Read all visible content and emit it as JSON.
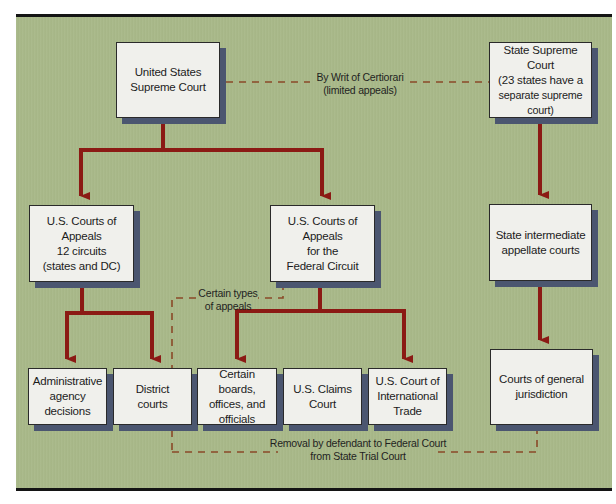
{
  "diagram": {
    "nodes": {
      "us_supreme_court": {
        "lines": [
          "United States",
          "Supreme Court"
        ]
      },
      "state_supreme_court": {
        "lines": [
          "State Supreme Court",
          "(23 states have a",
          "separate supreme court)"
        ]
      },
      "us_courts_of_appeals": {
        "lines": [
          "U.S. Courts of Appeals",
          "12 circuits",
          "(states and DC)"
        ]
      },
      "federal_circuit": {
        "lines": [
          "U.S. Courts of Appeals",
          "for the",
          "Federal Circuit"
        ]
      },
      "state_intermediate": {
        "lines": [
          "State intermediate",
          "appellate courts"
        ]
      },
      "admin_agency": {
        "lines": [
          "Administrative",
          "agency",
          "decisions"
        ]
      },
      "district_courts": {
        "lines": [
          "District",
          "courts"
        ]
      },
      "certain_boards": {
        "lines": [
          "Certain boards,",
          "offices, and",
          "officials"
        ]
      },
      "claims_court": {
        "lines": [
          "U.S. Claims",
          "Court"
        ]
      },
      "international_trade": {
        "lines": [
          "U.S. Court of",
          "International",
          "Trade"
        ]
      },
      "general_jurisdiction": {
        "lines": [
          "Courts of general",
          "jurisdiction"
        ]
      }
    },
    "edge_labels": {
      "certiorari": {
        "lines": [
          "By Writ of Certiorari",
          "(limited appeals)"
        ]
      },
      "certain_types": {
        "lines": [
          "Certain types",
          "of appeals"
        ]
      },
      "removal": {
        "lines": [
          "Removal by defendant to Federal Court",
          "from State Trial Court"
        ]
      }
    },
    "colors": {
      "background": "#a8b888",
      "box_fill": "#f0f0ec",
      "box_shadow": "#4b5670",
      "solid_arrow": "#8b1a14",
      "dashed_line": "#8a4a28"
    }
  }
}
